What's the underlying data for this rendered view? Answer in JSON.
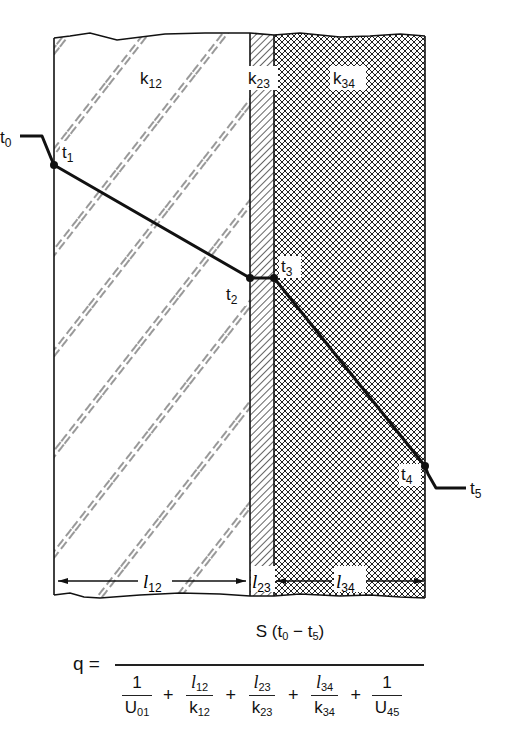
{
  "diagram": {
    "layers": [
      {
        "id": "layer-1",
        "conductivity_label": "k",
        "conductivity_sub": "12",
        "thickness_label": "l",
        "thickness_sub": "12",
        "pattern": "dashed-diagonal"
      },
      {
        "id": "layer-2",
        "conductivity_label": "k",
        "conductivity_sub": "23",
        "thickness_label": "l",
        "thickness_sub": "23",
        "pattern": "dense-hatch"
      },
      {
        "id": "layer-3",
        "conductivity_label": "k",
        "conductivity_sub": "34",
        "thickness_label": "l",
        "thickness_sub": "34",
        "pattern": "crosshatch"
      }
    ],
    "temperatures": [
      {
        "label": "t",
        "sub": "0"
      },
      {
        "label": "t",
        "sub": "1"
      },
      {
        "label": "t",
        "sub": "2"
      },
      {
        "label": "t",
        "sub": "3"
      },
      {
        "label": "t",
        "sub": "4"
      },
      {
        "label": "t",
        "sub": "5"
      }
    ]
  },
  "formula": {
    "lhs": "q =",
    "numerator": {
      "S": "S (t",
      "t0sub": "0",
      "minus": " − t",
      "t5sub": "5",
      "close": ")"
    },
    "terms": [
      {
        "top": "1",
        "bottom": "U",
        "bottom_sub": "01"
      },
      {
        "top": "l",
        "top_sub": "12",
        "bottom": "k",
        "bottom_sub": "12"
      },
      {
        "top": "l",
        "top_sub": "23",
        "bottom": "k",
        "bottom_sub": "23"
      },
      {
        "top": "l",
        "top_sub": "34",
        "bottom": "k",
        "bottom_sub": "34"
      },
      {
        "top": "1",
        "bottom": "U",
        "bottom_sub": "45"
      }
    ],
    "plus": "+"
  }
}
